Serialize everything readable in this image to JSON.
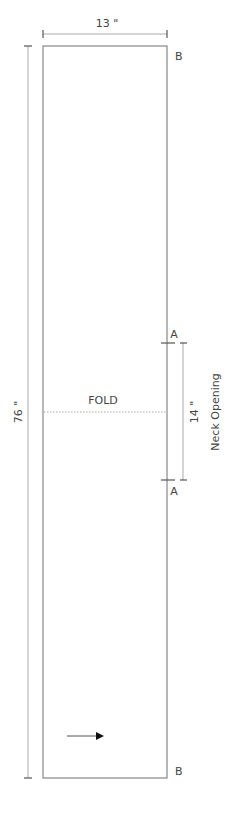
{
  "pattern": {
    "width_label": "13 \"",
    "length_label": "76 \"",
    "fold_label": "FOLD",
    "neck_dimension_label": "14 \"",
    "neck_label": "Neck Opening",
    "corner_labels": {
      "top_right": "B",
      "bottom_right": "B",
      "neck_top": "A",
      "neck_bottom": "A"
    },
    "grainline_icon": "arrow-right-icon",
    "colors": {
      "outline": "#888888",
      "dimension": "#999999",
      "fold_line": "#aaaaaa",
      "text": "#444444"
    }
  }
}
